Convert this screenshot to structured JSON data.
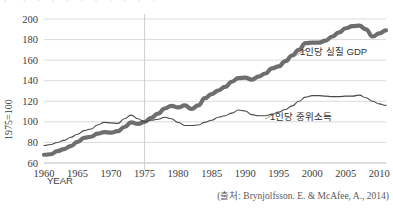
{
  "figure": {
    "top_cut_text": "⌐ ¬ ¬  ¬  ¬ ¬   ¬  ¬  ¬ ¬ ¬",
    "source_note": "(출처: Brynjolfsson. E. & McAfee, A., 2014)",
    "colors": {
      "gdp_line": "#6e6e6e",
      "median_line": "#4a4a4a",
      "gridline": "#d0d0d0",
      "text": "#3d3d3d",
      "background": "#ffffff"
    }
  },
  "chart_data": {
    "type": "line",
    "title": "",
    "subtitle": "",
    "xlabel": "YEAR",
    "ylabel": "1975=100",
    "xlim": [
      1960,
      2011
    ],
    "ylim": [
      60,
      200
    ],
    "grid": true,
    "legend": "inline-annotations",
    "xticks": [
      1960,
      1965,
      1970,
      1975,
      1980,
      1985,
      1990,
      1995,
      2000,
      2005,
      2010
    ],
    "yticks": [
      60,
      80,
      100,
      120,
      140,
      160,
      180,
      200
    ],
    "reference_line_x": 1975,
    "annotations": [
      {
        "text": "1인당 실질 GDP",
        "x": 2000,
        "y": 170,
        "series": "gdp_per_capita"
      },
      {
        "text": "1인당 중위소득",
        "x": 1997,
        "y": 112,
        "series": "median_income_per_capita"
      }
    ],
    "x": [
      1960,
      1961,
      1962,
      1963,
      1964,
      1965,
      1966,
      1967,
      1968,
      1969,
      1970,
      1971,
      1972,
      1973,
      1974,
      1975,
      1976,
      1977,
      1978,
      1979,
      1980,
      1981,
      1982,
      1983,
      1984,
      1985,
      1986,
      1987,
      1988,
      1989,
      1990,
      1991,
      1992,
      1993,
      1994,
      1995,
      1996,
      1997,
      1998,
      1999,
      2000,
      2001,
      2002,
      2003,
      2004,
      2005,
      2006,
      2007,
      2008,
      2009,
      2010,
      2011
    ],
    "series": [
      {
        "name": "1인당 실질 GDP",
        "name_en": "Real GDP per capita",
        "style": "thick",
        "values": [
          68,
          68.5,
          71.5,
          73.5,
          76.5,
          80.5,
          84.5,
          85.5,
          88.5,
          90,
          89.5,
          91,
          95,
          99.5,
          98,
          100,
          104,
          108,
          113,
          115.5,
          114,
          116,
          112.5,
          116,
          123,
          127,
          130.5,
          134,
          139,
          142.5,
          143,
          141,
          144,
          147,
          152,
          154,
          159,
          164.5,
          170,
          176.5,
          177,
          177,
          179,
          183,
          187,
          191,
          193,
          193.5,
          190,
          183,
          186,
          189
        ]
      },
      {
        "name": "1인당 중위소득",
        "name_en": "Median income per capita",
        "style": "thin",
        "values": [
          77,
          78,
          80,
          82,
          85,
          88,
          91.5,
          93,
          97,
          99.5,
          99,
          98.5,
          103,
          106.5,
          103,
          100,
          101.5,
          102.5,
          104.5,
          103,
          99.5,
          96.5,
          96.5,
          97,
          99.5,
          101.5,
          104.5,
          106,
          108.5,
          111.5,
          110.5,
          107,
          106,
          106,
          107.5,
          109.5,
          112,
          115.5,
          120,
          124,
          125.5,
          125.5,
          125,
          124.5,
          124.5,
          125,
          125,
          126,
          123.5,
          120,
          117.5,
          116
        ]
      }
    ]
  }
}
